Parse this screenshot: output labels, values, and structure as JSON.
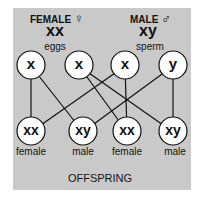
{
  "parents": {
    "female": {
      "label": "FEMALE",
      "symbol": "♀",
      "genotype": "xx",
      "gamete": "eggs"
    },
    "male": {
      "label": "MALE",
      "symbol": "♂",
      "genotype": "xy",
      "gamete": "sperm"
    }
  },
  "gametes": [
    "x",
    "x",
    "x",
    "y"
  ],
  "offspring": [
    {
      "genotype": "xx",
      "sex": "female"
    },
    {
      "genotype": "xy",
      "sex": "male"
    },
    {
      "genotype": "xx",
      "sex": "female"
    },
    {
      "genotype": "xy",
      "sex": "male"
    }
  ],
  "footer": "OFFSPRING",
  "colors": {
    "panel": "#c9c9c9",
    "circle": "#ffffff",
    "line": "#111111"
  }
}
